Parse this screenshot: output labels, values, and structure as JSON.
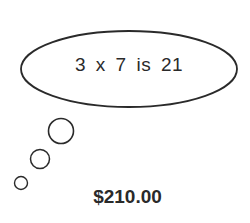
{
  "thought_bubble": {
    "text": "3 x 7 is 21"
  },
  "price": {
    "text": "$210.00"
  },
  "colors": {
    "stroke": "#2a2a2a",
    "background": "#ffffff"
  }
}
